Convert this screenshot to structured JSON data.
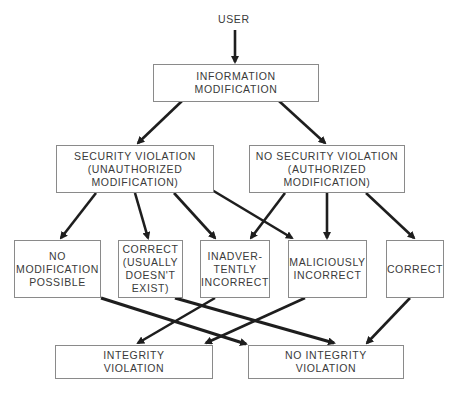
{
  "diagram": {
    "start_label": "USER",
    "nodes": {
      "info_mod": "INFORMATION\nMODIFICATION",
      "sec_violation": "SECURITY VIOLATION\n(UNAUTHORIZED\nMODIFICATION)",
      "no_sec_violation": "NO SECURITY VIOLATION\n(AUTHORIZED\nMODIFICATION)",
      "no_mod_possible": "NO\nMODIFICATION\nPOSSIBLE",
      "correct_usually": "CORRECT\n(USUALLY\nDOESN'T\nEXIST)",
      "inadvertently": "INADVER-\nTENTLY\nINCORRECT",
      "maliciously": "MALICIOUSLY\nINCORRECT",
      "correct": "CORRECT",
      "integrity_violation": "INTEGRITY\nVIOLATION",
      "no_integrity_violation": "NO INTEGRITY\nVIOLATION"
    },
    "edges": [
      {
        "from": "USER",
        "to": "INFORMATION MODIFICATION"
      },
      {
        "from": "INFORMATION MODIFICATION",
        "to": "SECURITY VIOLATION"
      },
      {
        "from": "INFORMATION MODIFICATION",
        "to": "NO SECURITY VIOLATION"
      },
      {
        "from": "SECURITY VIOLATION",
        "to": "NO MODIFICATION POSSIBLE"
      },
      {
        "from": "SECURITY VIOLATION",
        "to": "CORRECT (USUALLY DOESN'T EXIST)"
      },
      {
        "from": "SECURITY VIOLATION",
        "to": "INADVERTENTLY INCORRECT"
      },
      {
        "from": "SECURITY VIOLATION",
        "to": "MALICIOUSLY INCORRECT"
      },
      {
        "from": "NO SECURITY VIOLATION",
        "to": "INADVERTENTLY INCORRECT"
      },
      {
        "from": "NO SECURITY VIOLATION",
        "to": "MALICIOUSLY INCORRECT"
      },
      {
        "from": "NO SECURITY VIOLATION",
        "to": "CORRECT"
      },
      {
        "from": "NO MODIFICATION POSSIBLE",
        "to": "NO INTEGRITY VIOLATION"
      },
      {
        "from": "CORRECT (USUALLY DOESN'T EXIST)",
        "to": "NO INTEGRITY VIOLATION"
      },
      {
        "from": "INADVERTENTLY INCORRECT",
        "to": "INTEGRITY VIOLATION"
      },
      {
        "from": "MALICIOUSLY INCORRECT",
        "to": "INTEGRITY VIOLATION"
      },
      {
        "from": "CORRECT",
        "to": "NO INTEGRITY VIOLATION"
      }
    ],
    "colors": {
      "line": "#1e1e1e",
      "box_border": "#8a8a8a",
      "text": "#3a3a3a",
      "background": "#ffffff"
    }
  }
}
